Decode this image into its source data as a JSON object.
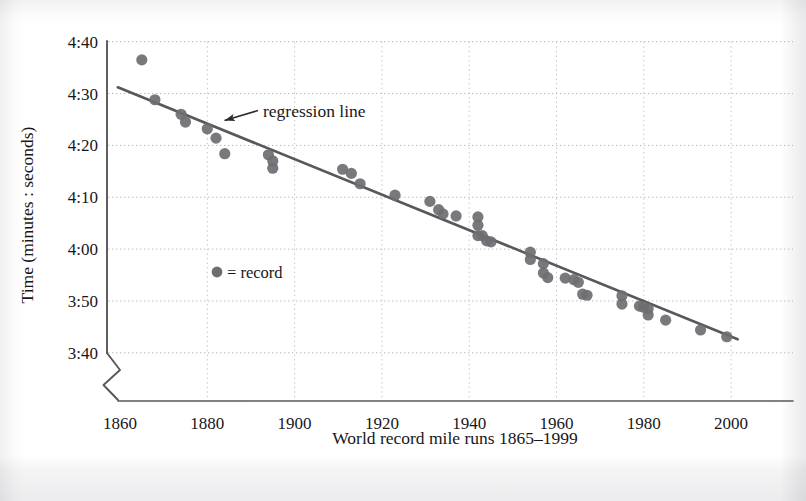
{
  "figure": {
    "background_color": "#ffffff",
    "axis_color": "#58585c",
    "grid_color": "#b9b9bd",
    "marker_color": "#6e6e72",
    "line_color": "#58585c",
    "text_color": "#17171a"
  },
  "chart_data": {
    "type": "scatter",
    "title": "",
    "xlabel": "World record mile runs 1865–1999",
    "ylabel": "Time (minutes : seconds)",
    "xlim": [
      1858,
      2004
    ],
    "ylim_seconds": [
      220,
      280
    ],
    "xticks": [
      1860,
      1880,
      1900,
      1920,
      1940,
      1960,
      1980,
      2000
    ],
    "xtick_labels": [
      "1860",
      "1880",
      "1900",
      "1920",
      "1940",
      "1960",
      "1980",
      "2000"
    ],
    "yticks_seconds": [
      280,
      270,
      260,
      250,
      240,
      230,
      220
    ],
    "ytick_labels": [
      "4:40",
      "4:30",
      "4:20",
      "4:10",
      "4:00",
      "3:50",
      "3:40"
    ],
    "grid": true,
    "grid_style": "dotted",
    "y_axis_break": true,
    "legend": {
      "marker_label": "= record",
      "position": "inside-left"
    },
    "annotations": [
      {
        "text": "regression line",
        "points_to": "trend-line",
        "arrow": true
      }
    ],
    "series": [
      {
        "name": "record",
        "marker": "filled-circle",
        "points": [
          {
            "x": 1865,
            "y": "4:36.5",
            "y_seconds": 276.5
          },
          {
            "x": 1868,
            "y": "4:28.8",
            "y_seconds": 268.8
          },
          {
            "x": 1874,
            "y": "4:26.0",
            "y_seconds": 266.0
          },
          {
            "x": 1875,
            "y": "4:24.5",
            "y_seconds": 264.5
          },
          {
            "x": 1880,
            "y": "4:23.2",
            "y_seconds": 263.2
          },
          {
            "x": 1882,
            "y": "4:21.4",
            "y_seconds": 261.4
          },
          {
            "x": 1884,
            "y": "4:18.4",
            "y_seconds": 258.4
          },
          {
            "x": 1894,
            "y": "4:18.2",
            "y_seconds": 258.2
          },
          {
            "x": 1895,
            "y": "4:17.0",
            "y_seconds": 257.0
          },
          {
            "x": 1895,
            "y": "4:15.6",
            "y_seconds": 255.6
          },
          {
            "x": 1911,
            "y": "4:15.4",
            "y_seconds": 255.4
          },
          {
            "x": 1913,
            "y": "4:14.6",
            "y_seconds": 254.6
          },
          {
            "x": 1915,
            "y": "4:12.6",
            "y_seconds": 252.6
          },
          {
            "x": 1923,
            "y": "4:10.4",
            "y_seconds": 250.4
          },
          {
            "x": 1931,
            "y": "4:09.2",
            "y_seconds": 249.2
          },
          {
            "x": 1933,
            "y": "4:07.6",
            "y_seconds": 247.6
          },
          {
            "x": 1934,
            "y": "4:06.8",
            "y_seconds": 246.8
          },
          {
            "x": 1937,
            "y": "4:06.4",
            "y_seconds": 246.4
          },
          {
            "x": 1942,
            "y": "4:06.2",
            "y_seconds": 246.2
          },
          {
            "x": 1942,
            "y": "4:04.6",
            "y_seconds": 244.6
          },
          {
            "x": 1942,
            "y": "4:02.6",
            "y_seconds": 242.6
          },
          {
            "x": 1943,
            "y": "4:02.6",
            "y_seconds": 242.6
          },
          {
            "x": 1944,
            "y": "4:01.6",
            "y_seconds": 241.6
          },
          {
            "x": 1945,
            "y": "4:01.4",
            "y_seconds": 241.4
          },
          {
            "x": 1954,
            "y": "3:59.4",
            "y_seconds": 239.4
          },
          {
            "x": 1954,
            "y": "3:58.0",
            "y_seconds": 238.0
          },
          {
            "x": 1957,
            "y": "3:57.2",
            "y_seconds": 237.2
          },
          {
            "x": 1957,
            "y": "3:55.4",
            "y_seconds": 235.4
          },
          {
            "x": 1958,
            "y": "3:54.5",
            "y_seconds": 234.5
          },
          {
            "x": 1962,
            "y": "3:54.4",
            "y_seconds": 234.4
          },
          {
            "x": 1964,
            "y": "3:54.1",
            "y_seconds": 234.1
          },
          {
            "x": 1965,
            "y": "3:53.6",
            "y_seconds": 233.6
          },
          {
            "x": 1966,
            "y": "3:51.3",
            "y_seconds": 231.3
          },
          {
            "x": 1967,
            "y": "3:51.1",
            "y_seconds": 231.1
          },
          {
            "x": 1975,
            "y": "3:51.0",
            "y_seconds": 231.0
          },
          {
            "x": 1975,
            "y": "3:49.4",
            "y_seconds": 229.4
          },
          {
            "x": 1979,
            "y": "3:49.0",
            "y_seconds": 229.0
          },
          {
            "x": 1980,
            "y": "3:48.8",
            "y_seconds": 228.8
          },
          {
            "x": 1981,
            "y": "3:48.5",
            "y_seconds": 228.5
          },
          {
            "x": 1981,
            "y": "3:47.3",
            "y_seconds": 227.3
          },
          {
            "x": 1985,
            "y": "3:46.3",
            "y_seconds": 226.3
          },
          {
            "x": 1993,
            "y": "3:44.4",
            "y_seconds": 224.4
          },
          {
            "x": 1999,
            "y": "3:43.1",
            "y_seconds": 223.1
          }
        ]
      }
    ],
    "trend_line": {
      "name": "regression line",
      "x_start": 1859.5,
      "y_start_seconds": 271.2,
      "x_end": 2001.5,
      "y_end_seconds": 222.6
    }
  }
}
